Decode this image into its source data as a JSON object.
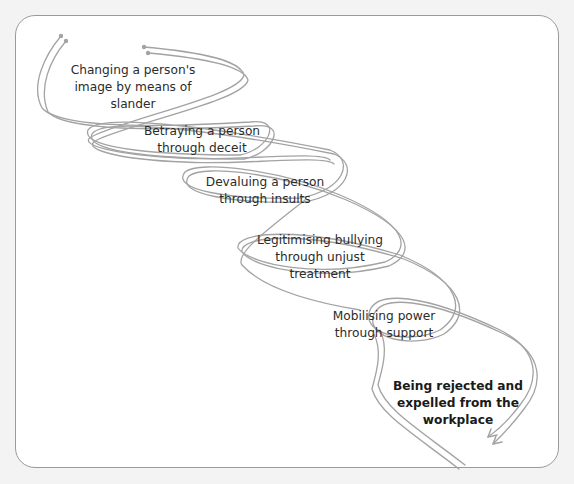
{
  "diagram": {
    "type": "spiral-process",
    "ribbon_color": "#a3a3a3",
    "card_border_color": "#9a9a9a",
    "background_color": "#f3f3f3",
    "steps": [
      {
        "lines": [
          "Changing a person's",
          "image by means of",
          "slander"
        ],
        "emphasis": false
      },
      {
        "lines": [
          "Betraying a person",
          "through deceit"
        ],
        "emphasis": false
      },
      {
        "lines": [
          "Devaluing a person",
          "through insults"
        ],
        "emphasis": false
      },
      {
        "lines": [
          "Legitimising bullying",
          "through unjust",
          "treatment"
        ],
        "emphasis": false
      },
      {
        "lines": [
          "Mobilising power",
          "through support"
        ],
        "emphasis": false
      },
      {
        "lines": [
          "Being rejected and",
          "expelled from the",
          "workplace"
        ],
        "emphasis": true
      }
    ],
    "end_marker": "arrow-icon"
  }
}
